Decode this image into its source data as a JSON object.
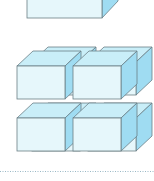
{
  "figure": {
    "colors": {
      "front_face": "#e6f7fb",
      "top_face": "#c9eef8",
      "side_face": "#9fdcf2",
      "edge": "#6b7f86",
      "dotted_rule": "#9ab8c6",
      "background": "#ffffff"
    },
    "top_prism": {
      "label": ""
    },
    "cube_stack": {
      "layers": 2,
      "rows": 2,
      "columns": 2,
      "count": 8
    },
    "divider": {
      "style": "dotted"
    }
  }
}
